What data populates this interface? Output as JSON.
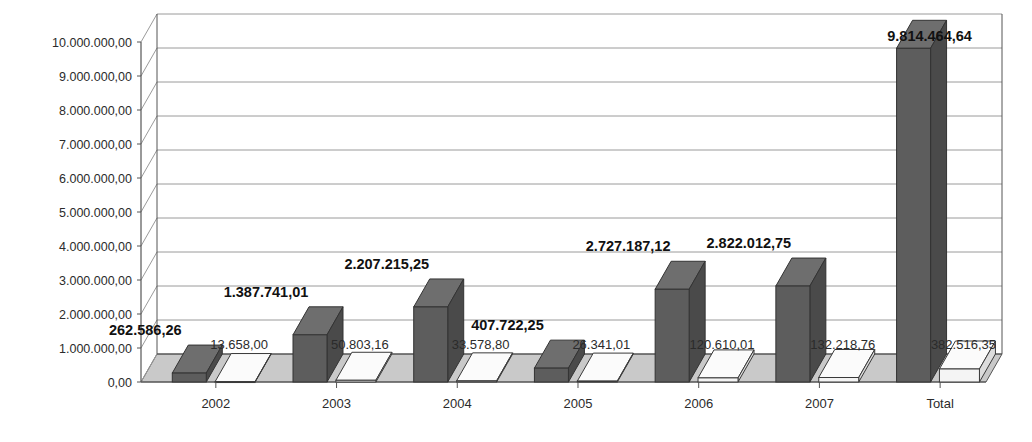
{
  "chart_data": {
    "type": "bar",
    "title": "",
    "subtitle": "",
    "xlabel": "",
    "ylabel": "",
    "grid": true,
    "legend": "none",
    "three_d": true,
    "ylim": [
      0,
      10000000
    ],
    "categories": [
      "2002",
      "2003",
      "2004",
      "2005",
      "2006",
      "2007",
      "Total"
    ],
    "ytick_labels": [
      "0,00",
      "1.000.000,00",
      "2.000.000,00",
      "3.000.000,00",
      "4.000.000,00",
      "5.000.000,00",
      "6.000.000,00",
      "7.000.000,00",
      "8.000.000,00",
      "9.000.000,00",
      "10.000.000,00"
    ],
    "ytick_values": [
      0,
      1000000,
      2000000,
      3000000,
      4000000,
      5000000,
      6000000,
      7000000,
      8000000,
      9000000,
      10000000
    ],
    "series": [
      {
        "name": "series-1",
        "color": "#5d5d5d",
        "values": [
          262586.26,
          1387741.01,
          2207215.25,
          407722.25,
          2727187.12,
          2822012.75,
          9814464.64
        ],
        "labels": [
          "262.586,26",
          "1.387.741,01",
          "2.207.215,25",
          "407.722,25",
          "2.727.187,12",
          "2.822.012,75",
          "9.814.464,64"
        ]
      },
      {
        "name": "series-2",
        "color": "#f2f2f2",
        "values": [
          13658.0,
          50803.16,
          33578.8,
          26341.01,
          120610.01,
          132218.76,
          382516.35
        ],
        "labels": [
          "13.658,00",
          "50.803,16",
          "33.578,80",
          "26.341,01",
          "120.610,01",
          "132.218,76",
          "382.516,35"
        ]
      }
    ]
  },
  "colors": {
    "bar_front": "#5d5d5d",
    "bar_top": "#6e6e6e",
    "bar_side": "#4a4a4a",
    "bar2_front": "#f4f4f4",
    "bar2_top": "#fbfbfb",
    "bar2_side": "#dcdcdc",
    "floor": "#c9c9c9",
    "grid": "#9a9a9a",
    "axis": "#555555",
    "background": "#ffffff"
  }
}
